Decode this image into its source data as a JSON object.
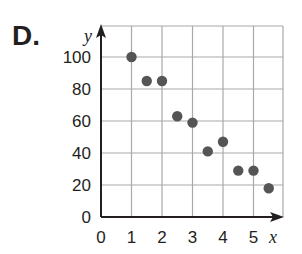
{
  "problem_label": "D.",
  "chart_data": {
    "type": "scatter",
    "title": "",
    "xlabel": "x",
    "ylabel": "y",
    "x_ticks": [
      "0",
      "1",
      "2",
      "3",
      "4",
      "5"
    ],
    "y_ticks": [
      "0",
      "20",
      "40",
      "60",
      "80",
      "100"
    ],
    "xlim": [
      0,
      5.9
    ],
    "ylim": [
      0,
      120
    ],
    "grid": true,
    "legend": null,
    "points": [
      {
        "x": 1,
        "y": 100
      },
      {
        "x": 1.5,
        "y": 85
      },
      {
        "x": 2,
        "y": 85
      },
      {
        "x": 2.5,
        "y": 63
      },
      {
        "x": 3,
        "y": 59
      },
      {
        "x": 3.5,
        "y": 41
      },
      {
        "x": 4,
        "y": 47
      },
      {
        "x": 4.5,
        "y": 29
      },
      {
        "x": 5,
        "y": 29
      },
      {
        "x": 5.5,
        "y": 18
      }
    ],
    "point_color": "#555555",
    "grid_color": "#a7a9ac",
    "axis_color": "#231f20"
  }
}
